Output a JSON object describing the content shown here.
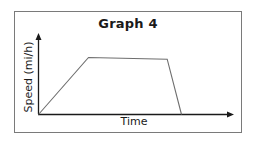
{
  "chart_data": {
    "type": "line",
    "title": "Graph 4",
    "xlabel": "Time",
    "ylabel": "Speed (mi/h)",
    "x_ticks": [],
    "y_ticks": [],
    "grid": false,
    "legend": null,
    "series": [
      {
        "name": "Speed",
        "points": [
          {
            "x": 0,
            "y": 0
          },
          {
            "x": 0.35,
            "y": 1.0
          },
          {
            "x": 0.9,
            "y": 0.97
          },
          {
            "x": 1.0,
            "y": 0
          }
        ]
      }
    ],
    "xlim": [
      0,
      1.3
    ],
    "ylim": [
      0,
      1.4
    ],
    "axes": {
      "x_arrow": true,
      "y_arrow": true
    }
  },
  "colors": {
    "axis": "#1a1a1a",
    "line": "#6e6e6e",
    "frame": "#7a7a7a",
    "text": "#1a1a1a"
  }
}
